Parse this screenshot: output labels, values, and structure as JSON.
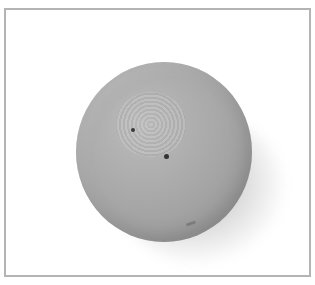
{
  "image": {
    "subject": "orange",
    "description": "Grayscale photograph of a whole citrus fruit (orange) with a stem-end dimple, shadow cast to lower right, inside a gray rectangular frame",
    "colors": {
      "background": "#ffffff",
      "frame_border": "#b4b4b4",
      "fruit_light": "#bdbdbd",
      "fruit_dark": "#8a8a8a",
      "stem_dot": "#333333"
    }
  }
}
